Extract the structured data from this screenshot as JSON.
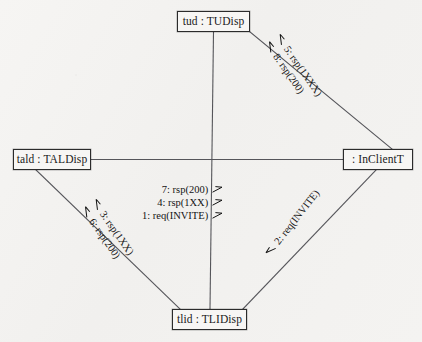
{
  "diagram": {
    "type": "uml-communication-diagram",
    "background_color": "#f3f2f0",
    "line_color": "#4a4a4a",
    "text_color": "#141414"
  },
  "nodes": [
    {
      "id": "tud",
      "label": "tud : TUDisp",
      "role": "lifeline",
      "position": "top"
    },
    {
      "id": "tald",
      "label": "tald : TALDisp",
      "role": "lifeline",
      "position": "left"
    },
    {
      "id": "incl",
      "label": ": InClientT",
      "role": "lifeline",
      "position": "right"
    },
    {
      "id": "tlid",
      "label": "tlid : TLIDisp",
      "role": "lifeline",
      "position": "bottom"
    }
  ],
  "links": [
    {
      "id": "link-tud-tlid",
      "from": "tud",
      "to": "tlid",
      "orientation": "vertical"
    },
    {
      "id": "link-tald-incl",
      "from": "tald",
      "to": "incl",
      "orientation": "horizontal"
    },
    {
      "id": "link-tud-incl",
      "from": "tud",
      "to": "incl",
      "orientation": "diagonal-ne"
    },
    {
      "id": "link-tald-tlid",
      "from": "tald",
      "to": "tlid",
      "orientation": "diagonal-sw"
    },
    {
      "id": "link-tlid-incl",
      "from": "tlid",
      "to": "incl",
      "orientation": "diagonal-se"
    }
  ],
  "message_groups": {
    "center": {
      "link": "link-tud-tlid",
      "arrow_side": "right",
      "messages": [
        {
          "text": "7: rsp(200)",
          "sequence": 7,
          "arrow": "half-arrow-right"
        },
        {
          "text": "4: rsp(1XX)",
          "sequence": 4,
          "arrow": "half-arrow-right"
        },
        {
          "text": "1: req(INVITE)",
          "sequence": 1,
          "arrow": "half-arrow-right"
        }
      ]
    },
    "northeast": {
      "link": "link-tud-incl",
      "arrow_side": "left",
      "messages": [
        {
          "text": "5: rsp(1XXX)",
          "sequence": 5,
          "arrow": "half-arrow-left"
        },
        {
          "text": "8: rsp(200)",
          "sequence": 8,
          "arrow": "half-arrow-left"
        }
      ]
    },
    "southwest": {
      "link": "link-tald-tlid",
      "arrow_side": "left",
      "messages": [
        {
          "text": "3: rsp(1XX)",
          "sequence": 3,
          "arrow": "half-arrow-left"
        },
        {
          "text": "6: rsp(200)",
          "sequence": 6,
          "arrow": "half-arrow-left"
        }
      ]
    },
    "southeast": {
      "link": "link-tlid-incl",
      "arrow_side": "left",
      "messages": [
        {
          "text": "2: req(INVITE)",
          "sequence": 2,
          "arrow": "half-arrow-left"
        }
      ]
    }
  }
}
